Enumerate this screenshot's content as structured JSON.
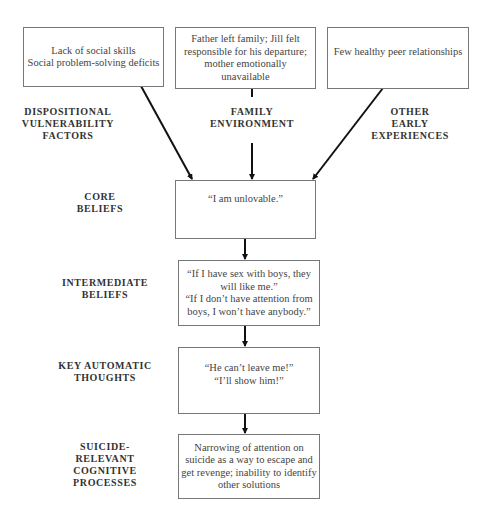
{
  "diagram": {
    "top_boxes": [
      {
        "lines": [
          "Lack of social skills",
          "Social problem-solving deficits"
        ]
      },
      {
        "lines": [
          "Father left family; Jill felt",
          "responsible for his departure;",
          "mother emotionally",
          "unavailable"
        ]
      },
      {
        "lines": [
          "Few healthy peer relationships"
        ]
      }
    ],
    "factor_labels": [
      {
        "lines": [
          "DISPOSITIONAL",
          "VULNERABILITY",
          "FACTORS"
        ]
      },
      {
        "lines": [
          "FAMILY",
          "ENVIRONMENT"
        ]
      },
      {
        "lines": [
          "OTHER",
          "EARLY",
          "EXPERIENCES"
        ]
      }
    ],
    "levels": [
      {
        "label_lines": [
          "CORE",
          "BELIEFS"
        ],
        "box_lines": [
          "“I am unlovable.”"
        ]
      },
      {
        "label_lines": [
          "INTERMEDIATE",
          "BELIEFS"
        ],
        "box_lines": [
          "“If I have sex with boys, they",
          "will like me.”",
          "“If I don’t have attention from",
          "boys, I won’t have anybody.”"
        ]
      },
      {
        "label_lines": [
          "KEY AUTOMATIC",
          "THOUGHTS"
        ],
        "box_lines": [
          "“He can’t leave me!”",
          "“I’ll show him!”"
        ]
      },
      {
        "label_lines": [
          "SUICIDE-",
          "RELEVANT",
          "COGNITIVE",
          "PROCESSES"
        ],
        "box_lines": [
          "Narrowing of attention on",
          "suicide as a way to escape and",
          "get revenge; inability to identify",
          "other solutions"
        ]
      }
    ],
    "colors": {
      "line": "#111111",
      "box_border": "#777777",
      "text": "#333333"
    }
  }
}
